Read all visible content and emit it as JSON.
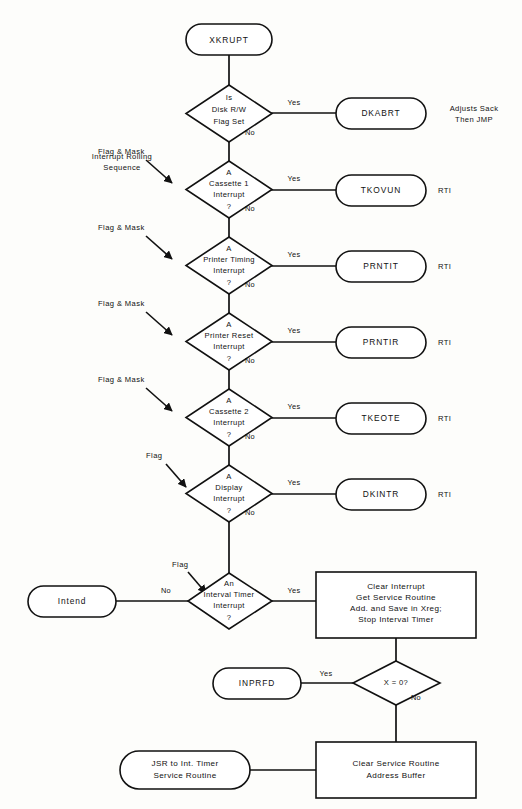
{
  "diagram": {
    "ink_color": "#111111",
    "paper_color": "#fdfdfb"
  },
  "start": {
    "label": "XKRUPT"
  },
  "notes": {
    "rolling_sequence_line1": "Interrupt Rolling",
    "rolling_sequence_line2": "Sequence",
    "dkabrt_note_line1": "Adjusts Sack",
    "dkabrt_note_line2": "Then JMP"
  },
  "edge_labels": {
    "yes": "Yes",
    "no": "No",
    "flag_and_mask": "Flag & Mask",
    "flag": "Flag"
  },
  "decisions": [
    {
      "id": "disk-rw",
      "lines": [
        "Is",
        "Disk R/W",
        "Flag Set"
      ],
      "yes_label": "Yes",
      "no_label": "No",
      "entry_annotation": ""
    },
    {
      "id": "cassette-1",
      "lines": [
        "A",
        "Cassette 1",
        "Interrupt",
        "?"
      ],
      "yes_label": "Yes",
      "no_label": "No",
      "entry_annotation": "Flag & Mask"
    },
    {
      "id": "printer-timing",
      "lines": [
        "A",
        "Printer Timing",
        "Interrupt",
        "?"
      ],
      "yes_label": "Yes",
      "no_label": "No",
      "entry_annotation": "Flag & Mask"
    },
    {
      "id": "printer-reset",
      "lines": [
        "A",
        "Printer Reset",
        "Interrupt",
        "?"
      ],
      "yes_label": "Yes",
      "no_label": "No",
      "entry_annotation": "Flag & Mask"
    },
    {
      "id": "cassette-2",
      "lines": [
        "A",
        "Cassette 2",
        "Interrupt",
        "?"
      ],
      "yes_label": "Yes",
      "no_label": "No",
      "entry_annotation": "Flag & Mask"
    },
    {
      "id": "display",
      "lines": [
        "A",
        "Display",
        "Interrupt",
        "?"
      ],
      "yes_label": "Yes",
      "no_label": "No",
      "entry_annotation": "Flag"
    },
    {
      "id": "interval-timer",
      "lines": [
        "An",
        "Interval Timer",
        "Interrupt",
        "?"
      ],
      "yes_label": "Yes",
      "no_label": "No",
      "entry_annotation": "Flag"
    }
  ],
  "terminals": [
    {
      "id": "dkabrt",
      "label": "DKABRT",
      "side_note": ""
    },
    {
      "id": "tkovun",
      "label": "TKOVUN",
      "side_note": "RTI"
    },
    {
      "id": "prntit",
      "label": "PRNTIT",
      "side_note": "RTI"
    },
    {
      "id": "prntir",
      "label": "PRNTIR",
      "side_note": "RTI"
    },
    {
      "id": "tkeote",
      "label": "TKEOTE",
      "side_note": "RTI"
    },
    {
      "id": "dkintr",
      "label": "DKINTR",
      "side_note": "RTI"
    }
  ],
  "intend_terminal": {
    "label": "Intend"
  },
  "inprfd_terminal": {
    "label": "INPRFD"
  },
  "jsr_terminal": {
    "lines": [
      "JSR to Int. Timer",
      "Service Routine"
    ]
  },
  "process_clear_interrupt": {
    "lines": [
      "Clear Interrupt",
      "Get Service Routine",
      "Add. and Save in Xreg;",
      "Stop Interval Timer"
    ]
  },
  "decision_x_zero": {
    "label": "X = 0?",
    "yes_label": "Yes",
    "no_label": "No"
  },
  "process_clear_buffer": {
    "lines": [
      "Clear Service Routine",
      "Address Buffer"
    ]
  }
}
